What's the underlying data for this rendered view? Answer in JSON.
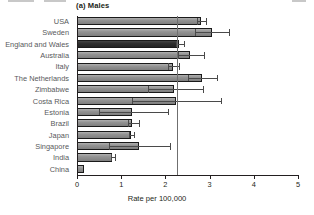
{
  "panel": {
    "title": "(a) Males"
  },
  "axis": {
    "x_title": "Rate per 100,000",
    "ticks": [
      "0",
      "1",
      "2",
      "3",
      "4",
      "5"
    ]
  },
  "chart_data": {
    "type": "bar",
    "orientation": "horizontal",
    "title": "(a) Males",
    "xlabel": "Rate per 100,000",
    "ylabel": "",
    "xlim": [
      0,
      5
    ],
    "xticks": [
      0,
      1,
      2,
      3,
      4,
      5
    ],
    "grid": false,
    "legend": null,
    "reference_line": 2.27,
    "highlight_category": "England and Wales",
    "categories": [
      "USA",
      "Sweden",
      "England and Wales",
      "Australia",
      "Italy",
      "The Netherlands",
      "Zimbabwe",
      "Costa Rica",
      "Estonia",
      "Brazil",
      "Japan",
      "Singapore",
      "India",
      "China"
    ],
    "values": [
      2.8,
      3.05,
      2.3,
      2.55,
      2.18,
      2.82,
      2.2,
      2.25,
      1.25,
      1.25,
      1.22,
      1.4,
      0.8,
      0.15
    ],
    "ci_low": [
      2.72,
      2.68,
      2.24,
      2.28,
      2.05,
      2.5,
      1.6,
      1.25,
      0.5,
      1.15,
      1.17,
      0.72,
      0.76,
      null
    ],
    "ci_high": [
      2.92,
      3.45,
      2.42,
      2.87,
      2.3,
      3.17,
      2.85,
      3.25,
      2.05,
      1.4,
      1.3,
      2.1,
      0.86,
      null
    ],
    "series": [
      {
        "name": "Rate per 100,000",
        "values": [
          2.8,
          3.05,
          2.3,
          2.55,
          2.18,
          2.82,
          2.2,
          2.25,
          1.25,
          1.25,
          1.22,
          1.4,
          0.8,
          0.15
        ]
      }
    ]
  }
}
